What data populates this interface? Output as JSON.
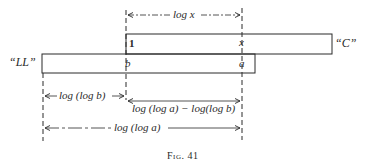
{
  "figure": {
    "caption": "Fig. 41",
    "scales": {
      "c": {
        "name": "“C”",
        "left_mark": "1",
        "right_mark": "x"
      },
      "ll": {
        "name": "“LL”",
        "left_mark": "b",
        "right_mark": "a"
      }
    },
    "dimensions": {
      "top": "log x",
      "log_log_b": "log (log b)",
      "difference": "log (log a) − log(log b)",
      "log_log_a": "log (log a)"
    },
    "colors": {
      "ink": "#2a2a2a",
      "background": "#ffffff"
    }
  }
}
